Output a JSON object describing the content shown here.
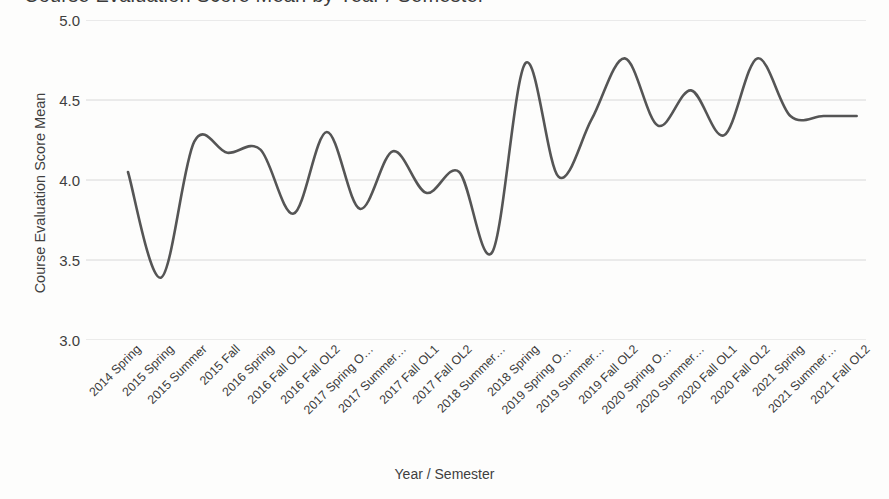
{
  "chart_data": {
    "type": "line",
    "title": "Course Evaluation Score Mean by Year / Semester",
    "xlabel": "Year / Semester",
    "ylabel": "Course Evaluation Score Mean",
    "ylim": [
      3.0,
      5.0
    ],
    "yticks": [
      5.0,
      4.5,
      4.0,
      3.5,
      3.0
    ],
    "ytick_labels": [
      "5.0",
      "4.5",
      "4.0",
      "3.5",
      "3.0"
    ],
    "grid": true,
    "legend": "none",
    "line_color": "#555555",
    "line_width": 2.6,
    "categories": [
      "2014 Spring",
      "2015 Spring",
      "2015 Summer",
      "2015 Fall",
      "2016 Spring",
      "2016 Fall OL1",
      "2016 Fall OL2",
      "2017 Spring O…",
      "2017 Summer…",
      "2017 Fall OL1",
      "2017 Fall OL2",
      "2018 Summer…",
      "2018 Spring",
      "2019 Spring O…",
      "2019 Summer…",
      "2019 Fall OL2",
      "2020 Spring O…",
      "2020 Summer…",
      "2020 Fall OL1",
      "2020 Fall OL2",
      "2021 Spring",
      "2021 Summer…",
      "2021 Fall OL2"
    ],
    "values": [
      4.05,
      3.39,
      4.24,
      4.17,
      4.19,
      3.79,
      4.3,
      3.82,
      4.18,
      3.92,
      4.05,
      3.55,
      4.73,
      4.02,
      4.38,
      4.76,
      4.34,
      4.56,
      4.28,
      4.76,
      4.4,
      4.4,
      4.4
    ],
    "series_name": "Course Evaluation Score Mean"
  },
  "axis": {
    "y_title": "Course Evaluation Score Mean",
    "x_title": "Year / Semester"
  }
}
